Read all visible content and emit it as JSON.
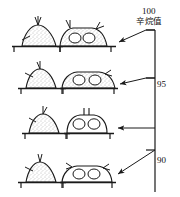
{
  "figure": {
    "title_visible": false,
    "axis": {
      "name": "octane-number-axis",
      "label_cjk": "辛烷值",
      "label_meaning": "octane number",
      "orientation": "vertical",
      "x_px": 155,
      "y_top_px": 30,
      "y_bottom_px": 192,
      "ticks": [
        {
          "value": "100",
          "y_px": 30,
          "label_x_px": 142,
          "label_y_px": 7,
          "tick_side": "left"
        },
        {
          "value": "95",
          "y_px": 78,
          "label_x_px": 157,
          "label_y_px": 80,
          "tick_side": "left"
        },
        {
          "value": "90",
          "y_px": 150,
          "label_x_px": 157,
          "label_y_px": 156,
          "tick_side": "left"
        }
      ]
    },
    "arrows": [
      {
        "name": "arrow-to-row-1",
        "from_x": 155,
        "from_y": 30,
        "to_x": 116,
        "to_y": 41,
        "style": "angled"
      },
      {
        "name": "arrow-to-row-2",
        "from_x": 155,
        "from_y": 78,
        "to_x": 116,
        "to_y": 82,
        "style": "angled"
      },
      {
        "name": "arrow-to-row-3",
        "from_x": 155,
        "from_y": 128,
        "to_x": 116,
        "to_y": 128,
        "style": "horizontal"
      },
      {
        "name": "arrow-to-row-4",
        "from_x": 155,
        "from_y": 150,
        "to_x": 114,
        "to_y": 174,
        "style": "diagonal"
      }
    ],
    "rows": [
      {
        "index": 1,
        "octane_value": "100",
        "baseline_y_px": 46,
        "shapes": [
          {
            "name": "mound-tall-stippled",
            "kind": "dome",
            "cx": 38,
            "width": 36,
            "height": 22,
            "fill": "stipple",
            "circles": 0,
            "antennae": 2,
            "label": ""
          },
          {
            "name": "mound-flat-two-cells",
            "kind": "trapezoid",
            "cx": 82,
            "width": 50,
            "height": 17,
            "fill": "stipple",
            "circles": 2,
            "antennae": 2,
            "label": ""
          }
        ]
      },
      {
        "index": 2,
        "octane_value": "95",
        "baseline_y_px": 88,
        "shapes": [
          {
            "name": "mound-tall-stippled",
            "kind": "dome",
            "cx": 40,
            "width": 34,
            "height": 20,
            "fill": "stipple",
            "circles": 0,
            "antennae": 1,
            "label": ""
          },
          {
            "name": "mound-wide-two-cells",
            "kind": "trapezoid",
            "cx": 88,
            "width": 56,
            "height": 15,
            "fill": "stipple",
            "circles": 2,
            "antennae": 1,
            "label": ""
          }
        ]
      },
      {
        "index": 3,
        "octane_value": "~92",
        "baseline_y_px": 133,
        "shapes": [
          {
            "name": "mound-tall-stippled",
            "kind": "dome",
            "cx": 42,
            "width": 32,
            "height": 20,
            "fill": "stipple",
            "circles": 0,
            "antennae": 1,
            "label": ""
          },
          {
            "name": "mound-round-two-cells",
            "kind": "rounded-trapezoid",
            "cx": 86,
            "width": 44,
            "height": 18,
            "fill": "plain",
            "circles": 2,
            "antennae": 2,
            "label": ""
          }
        ]
      },
      {
        "index": 4,
        "octane_value": "90",
        "baseline_y_px": 182,
        "shapes": [
          {
            "name": "mound-tall-stippled",
            "kind": "dome",
            "cx": 40,
            "width": 34,
            "height": 21,
            "fill": "stipple",
            "circles": 0,
            "antennae": 2,
            "label": ""
          },
          {
            "name": "mound-wide-two-cells",
            "kind": "trapezoid",
            "cx": 86,
            "width": 52,
            "height": 15,
            "fill": "plain",
            "circles": 2,
            "antennae": 2,
            "label": ""
          }
        ]
      }
    ],
    "colors": {
      "ink": "#1a1a1a",
      "background": "#ffffff",
      "stipple": "#8a8a8a"
    }
  }
}
